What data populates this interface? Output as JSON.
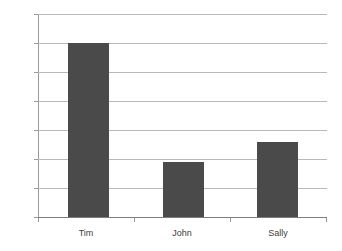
{
  "chart_data": {
    "type": "bar",
    "title": "",
    "subtitle": "",
    "xlabel": "",
    "ylabel": "",
    "categories": [
      "Tim",
      "John",
      "Sally"
    ],
    "values": [
      60,
      19,
      26
    ],
    "series": [
      {
        "name": "Series 1",
        "values": [
          60,
          19,
          26
        ],
        "color": "#4a4a4a"
      }
    ],
    "ylim": [
      0,
      70
    ],
    "y_ticks": [
      0,
      10,
      20,
      30,
      40,
      50,
      60,
      70
    ],
    "y_tick_labels": [
      "0",
      "10",
      "20",
      "30",
      "40",
      "50",
      "60",
      "70"
    ],
    "grid": "horizontal",
    "legend": "none",
    "background_color": "#ffffff",
    "gridline_color": "#b9b9b9",
    "axis_color": "#9a9a9a",
    "baseline_color": "#7d7d7d",
    "label_color": "#3d3d3d"
  }
}
